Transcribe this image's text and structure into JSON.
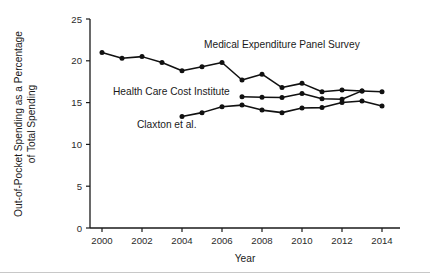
{
  "chart_data": {
    "type": "line",
    "title": "",
    "xlabel": "Year",
    "ylabel": "Out-of-Pocket Spending as a Percentage of Total Spending",
    "ylabel_line1": "Out-of-Pocket Spending as a Percentage",
    "ylabel_line2": "of Total Spending",
    "xlim": [
      1999.4,
      2014.9
    ],
    "ylim": [
      0,
      25
    ],
    "xticks": [
      2000,
      2002,
      2004,
      2006,
      2008,
      2010,
      2012,
      2014
    ],
    "xtick_labels": [
      "2000",
      "2002",
      "2004",
      "2006",
      "2008",
      "2010",
      "2012",
      "2014"
    ],
    "yticks": [
      0,
      5,
      10,
      15,
      20,
      25
    ],
    "ytick_labels": [
      "0",
      "5",
      "10",
      "15",
      "20",
      "25"
    ],
    "grid": false,
    "legend_position": "inline-annotations",
    "marker": "filled-circle",
    "line_color": "#111111",
    "series": [
      {
        "name": "Medical Expenditure Panel Survey",
        "x": [
          2000,
          2001,
          2002,
          2003,
          2004,
          2005,
          2006,
          2007,
          2008,
          2009,
          2010,
          2011,
          2012,
          2013,
          2014
        ],
        "values": [
          21.0,
          20.3,
          20.5,
          19.8,
          18.8,
          19.3,
          19.8,
          17.7,
          18.4,
          16.8,
          17.3,
          16.3,
          16.5,
          16.4,
          16.3
        ],
        "annotation": "Medical Expenditure Panel Survey",
        "annotation_x": 204,
        "annotation_y": 48
      },
      {
        "name": "Health Care Cost Institute",
        "x": [
          2007,
          2008,
          2009,
          2010,
          2011,
          2012,
          2013
        ],
        "values": [
          15.7,
          15.65,
          15.6,
          16.1,
          15.45,
          15.4,
          16.4
        ],
        "annotation": "Health Care Cost Institute",
        "annotation_x": 113,
        "annotation_y": 95
      },
      {
        "name": "Claxton et al.",
        "x": [
          2004,
          2005,
          2006,
          2007,
          2008,
          2009,
          2010,
          2011,
          2012,
          2013,
          2014
        ],
        "values": [
          13.35,
          13.8,
          14.5,
          14.7,
          14.1,
          13.8,
          14.35,
          14.4,
          15.0,
          15.2,
          14.6
        ],
        "annotation": "Claxton et al.",
        "annotation_x": 137,
        "annotation_y": 128
      }
    ]
  }
}
